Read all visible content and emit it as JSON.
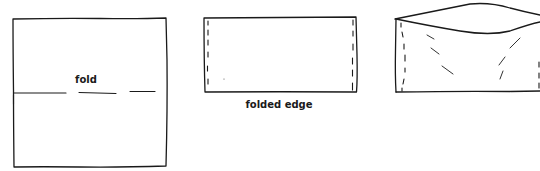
{
  "diagram": {
    "type": "fold-instructions",
    "figures": [
      {
        "id": "square-with-fold-line",
        "label": "fold"
      },
      {
        "id": "folded-rectangle",
        "label": "folded edge"
      },
      {
        "id": "opened-pocket",
        "label": ""
      }
    ],
    "colors": {
      "stroke": "#1a1a1a",
      "background": "#ffffff"
    }
  }
}
